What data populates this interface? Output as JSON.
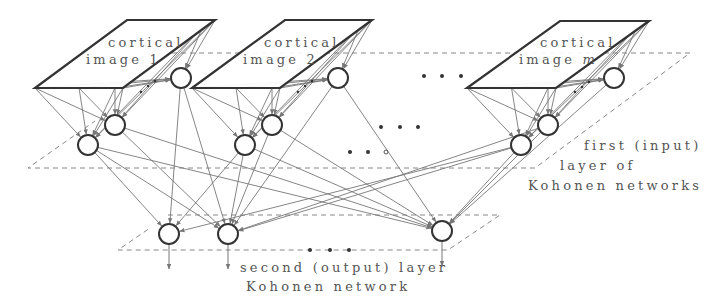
{
  "diagram": {
    "colors": {
      "stroke": "#333333",
      "arrow": "#777777",
      "dashed": "#888888",
      "text": "#555555",
      "background": "#ffffff"
    },
    "images": [
      {
        "id": "img1",
        "line1": "cortical",
        "line2": "image 1",
        "top": [
          [
            127,
            20
          ],
          [
            215,
            20
          ]
        ],
        "bottom": [
          [
            35,
            88
          ],
          [
            123,
            88
          ]
        ]
      },
      {
        "id": "img2",
        "line1": "cortical",
        "line2": "image 2",
        "top": [
          [
            285,
            20
          ],
          [
            372,
            20
          ]
        ],
        "bottom": [
          [
            192,
            88
          ],
          [
            280,
            88
          ]
        ]
      },
      {
        "id": "imgm",
        "line1": "cortical",
        "line2": "image ",
        "line2_italic": "m",
        "top": [
          [
            560,
            21
          ],
          [
            649,
            21
          ]
        ],
        "bottom": [
          [
            467,
            88
          ],
          [
            556,
            88
          ]
        ]
      }
    ],
    "first_layer_nodes": [
      {
        "id": "n1a",
        "x": 181,
        "y": 78
      },
      {
        "id": "n1b",
        "x": 115,
        "y": 125
      },
      {
        "id": "n1c",
        "x": 88,
        "y": 145
      },
      {
        "id": "n2a",
        "x": 338,
        "y": 78
      },
      {
        "id": "n2b",
        "x": 272,
        "y": 125
      },
      {
        "id": "n2c",
        "x": 245,
        "y": 145
      },
      {
        "id": "nma",
        "x": 614,
        "y": 78
      },
      {
        "id": "nmb",
        "x": 548,
        "y": 125
      },
      {
        "id": "nmc",
        "x": 521,
        "y": 145
      }
    ],
    "output_nodes": [
      {
        "id": "o1",
        "x": 169,
        "y": 234
      },
      {
        "id": "o2",
        "x": 228,
        "y": 234
      },
      {
        "id": "om",
        "x": 442,
        "y": 231
      }
    ],
    "ellipsis": "• • •",
    "labels": {
      "first_layer_line1": "first (input)",
      "first_layer_line2": "layer of",
      "first_layer_line3": "Kohonen networks",
      "output_layer_line1": "second (output) layer",
      "output_layer_line2": "Kohonen network"
    }
  }
}
